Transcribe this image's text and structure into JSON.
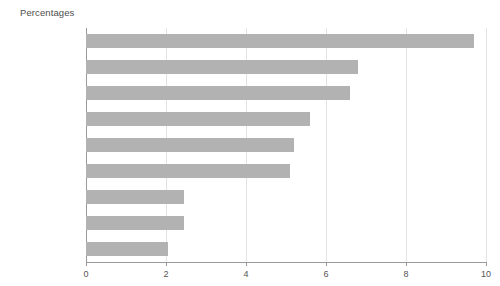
{
  "chart_data": {
    "type": "bar",
    "orientation": "horizontal",
    "title": "Percentages",
    "xlabel": "",
    "ylabel": "",
    "categories": [
      "North East",
      "North West",
      "Yorkshire and\nthe Humber",
      "West Midlands",
      "London",
      "East Midlands",
      "South West",
      "South East",
      "East"
    ],
    "values": [
      9.7,
      6.8,
      6.6,
      5.6,
      5.2,
      5.1,
      2.45,
      2.45,
      2.05
    ],
    "xlim": [
      0,
      10
    ],
    "xticks": [
      0,
      2,
      4,
      6,
      8,
      10
    ],
    "xtick_labels": [
      "0",
      "2",
      "4",
      "6",
      "8",
      "10"
    ],
    "grid": "vertical",
    "legend": null,
    "bar_color": "#b2b2b2",
    "axis_color": "#9a9a9a",
    "grid_color": "#e3e3e3",
    "background": "#ffffff"
  }
}
